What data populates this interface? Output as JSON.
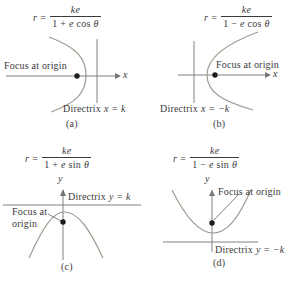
{
  "figure": {
    "colors": {
      "text": "#3b3b3b",
      "line": "#757575",
      "curve": "#a29a90",
      "dot": "#1c1c1c"
    },
    "panels": [
      {
        "id": "a",
        "caption": "(a)",
        "eq_var": "r",
        "eq_rel": "=",
        "eq_num": "ke",
        "eq_den_pre": "1 + ",
        "eq_den_var": "e",
        "eq_den_fn": " cos ",
        "eq_den_sym": "θ",
        "focus_label": "Focus at origin",
        "directrix_word": "Directrix",
        "directrix_math": "x = k",
        "axis_label": "x"
      },
      {
        "id": "b",
        "caption": "(b)",
        "eq_var": "r",
        "eq_rel": "=",
        "eq_num": "ke",
        "eq_den_pre": "1 − ",
        "eq_den_var": "e",
        "eq_den_fn": " cos ",
        "eq_den_sym": "θ",
        "focus_label": "Focus at origin",
        "directrix_word": "Directrix",
        "directrix_math": "x = −k",
        "axis_label": "x"
      },
      {
        "id": "c",
        "caption": "(c)",
        "eq_var": "r",
        "eq_rel": "=",
        "eq_num": "ke",
        "eq_den_pre": "1 + ",
        "eq_den_var": "e",
        "eq_den_fn": " sin ",
        "eq_den_sym": "θ",
        "focus_label_line1": "Focus at",
        "focus_label_line2": "origin",
        "directrix_word": "Directrix",
        "directrix_math": "y = k",
        "axis_label": "y"
      },
      {
        "id": "d",
        "caption": "(d)",
        "eq_var": "r",
        "eq_rel": "=",
        "eq_num": "ke",
        "eq_den_pre": "1 − ",
        "eq_den_var": "e",
        "eq_den_fn": " sin ",
        "eq_den_sym": "θ",
        "focus_label": "Focus at origin",
        "directrix_word": "Directrix",
        "directrix_math": "y = −k",
        "axis_label": "y"
      }
    ]
  }
}
